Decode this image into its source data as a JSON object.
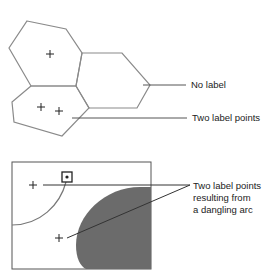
{
  "top_diagram": {
    "callouts": [
      {
        "text": "No label"
      },
      {
        "text": "Two label points"
      }
    ],
    "polygons": [
      {
        "name": "upper-polygon",
        "label_points": 1
      },
      {
        "name": "right-polygon",
        "label_points": 0
      },
      {
        "name": "lower-polygon",
        "label_points": 2
      }
    ]
  },
  "bottom_diagram": {
    "callout_lines": [
      "Two label points",
      "resulting from",
      "a dangling arc"
    ],
    "shaded_color": "#6b6b6b"
  },
  "colors": {
    "line": "#8a8a8a",
    "dark_line": "#333333",
    "fill": "#6b6b6b"
  }
}
